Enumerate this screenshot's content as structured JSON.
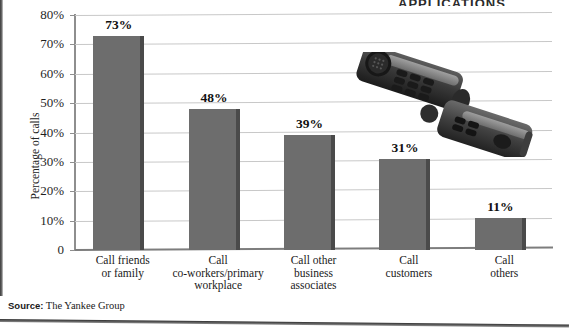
{
  "page": {
    "clipped_header_text": "APPLICATIONS",
    "source_label": "Source:",
    "source_text": "The Yankee Group",
    "phone_photo_alt": "cordless-phone-photo"
  },
  "chart_data": {
    "type": "bar",
    "title": "",
    "xlabel": "",
    "ylabel": "Percentage of calls",
    "ylim": [
      0,
      80
    ],
    "ytick_values": [
      0,
      10,
      20,
      30,
      40,
      50,
      60,
      70,
      80
    ],
    "ytick_labels": [
      "0",
      "10%",
      "20%",
      "30%",
      "40%",
      "50%",
      "60%",
      "70%",
      "80%"
    ],
    "grid": true,
    "legend": "none",
    "categories": [
      "Call friends\nor family",
      "Call\nco-workers/primary\nworkplace",
      "Call other\nbusiness\nassociates",
      "Call\ncustomers",
      "Call\nothers"
    ],
    "category_lines": [
      [
        "Call friends",
        "or family"
      ],
      [
        "Call",
        "co-workers/primary",
        "workplace"
      ],
      [
        "Call other",
        "business",
        "associates"
      ],
      [
        "Call",
        "customers"
      ],
      [
        "Call",
        "others"
      ]
    ],
    "values": [
      73,
      48,
      39,
      31,
      11
    ],
    "value_labels": [
      "73%",
      "48%",
      "39%",
      "31%",
      "11%"
    ],
    "bar_color": "#6d6d6d",
    "bar_shadow_color": "#4a4a4a",
    "grid_color": "#c8c8c8",
    "axis_color": "#8e8e8e"
  }
}
